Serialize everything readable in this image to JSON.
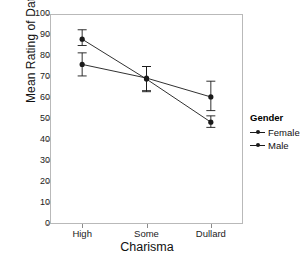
{
  "chart_data": {
    "type": "line",
    "title": "",
    "xlabel": "Charisma",
    "ylabel": "Mean Rating of Date",
    "categories": [
      "High",
      "Some",
      "Dullard"
    ],
    "ylim": [
      0,
      100
    ],
    "yticks": [
      0,
      10,
      20,
      30,
      40,
      50,
      60,
      70,
      80,
      90,
      100
    ],
    "grid": false,
    "legend": {
      "title": "Gender",
      "position": "right",
      "entries": [
        "Female",
        "Male"
      ]
    },
    "series": [
      {
        "name": "Female",
        "values": [
          76,
          69.5,
          60.5
        ],
        "error_low": [
          70.5,
          63,
          54
        ],
        "error_high": [
          81.5,
          75,
          68
        ],
        "marker": "circle",
        "color": "#1a1a1a"
      },
      {
        "name": "Male",
        "values": [
          88,
          69,
          48.5
        ],
        "error_low": [
          85,
          63.5,
          46
        ],
        "error_high": [
          92.5,
          75,
          51.5
        ],
        "marker": "circle",
        "color": "#1a1a1a"
      }
    ]
  },
  "axes": {
    "y_tick_labels": [
      "100",
      "90",
      "80",
      "70",
      "60",
      "50",
      "40",
      "30",
      "20",
      "10",
      "0"
    ],
    "x_tick_labels": [
      "High",
      "Some",
      "Dullard"
    ],
    "x_title": "Charisma",
    "y_title": "Mean Rating of Date"
  },
  "legend": {
    "title": "Gender",
    "items": [
      {
        "label": "Female"
      },
      {
        "label": "Male"
      }
    ]
  },
  "colors": {
    "ink": "#1a1a1a",
    "frame": "#b9b9b9",
    "background": "#ffffff"
  }
}
